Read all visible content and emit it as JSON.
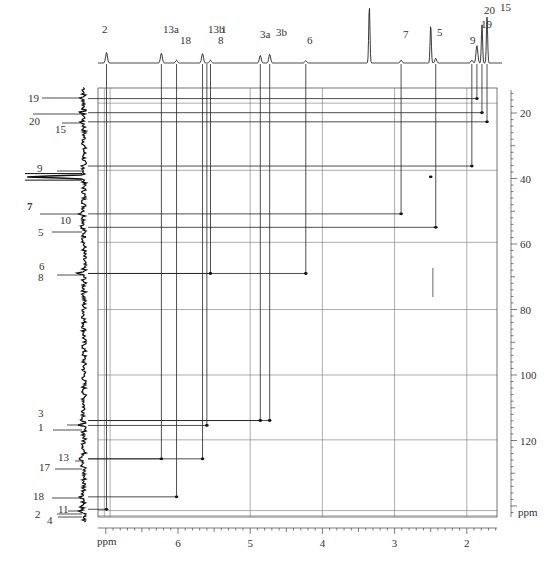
{
  "chart_data": {
    "type": "heatmap",
    "title": "",
    "subtitle": "2D HSQC NMR spectrum (1H-13C correlation)",
    "xlabel": "ppm",
    "ylabel": "ppm",
    "x_axis": {
      "label": "ppm",
      "ticks": [
        6,
        5,
        4,
        3,
        2
      ],
      "range": [
        7.05,
        1.55
      ],
      "reversed": true
    },
    "y_axis": {
      "label": "ppm",
      "ticks": [
        20,
        40,
        60,
        80,
        100,
        120
      ],
      "range": [
        13,
        144
      ],
      "position": "right"
    },
    "grid": true,
    "top_projection": {
      "label": "1H spectrum",
      "peaks": [
        {
          "label": "2",
          "ppm": 6.99,
          "height": 0.18
        },
        {
          "label": "13a",
          "ppm": 6.23,
          "height": 0.17
        },
        {
          "label": "18",
          "ppm": 6.02,
          "height": 0.05
        },
        {
          "label": "13b",
          "ppm": 5.66,
          "height": 0.16
        },
        {
          "label": "1",
          "ppm": 5.6,
          "height": 0.0
        },
        {
          "label": "8",
          "ppm": 5.55,
          "height": 0.05
        },
        {
          "label": "3a",
          "ppm": 4.86,
          "height": 0.13
        },
        {
          "label": "3b",
          "ppm": 4.73,
          "height": 0.15
        },
        {
          "label": "6",
          "ppm": 4.23,
          "height": 0.04
        },
        {
          "label": "",
          "ppm": 3.35,
          "height": 0.98
        },
        {
          "label": "7",
          "ppm": 2.91,
          "height": 0.05
        },
        {
          "label": "",
          "ppm": 2.5,
          "height": 0.66
        },
        {
          "label": "5",
          "ppm": 2.43,
          "height": 0.08
        },
        {
          "label": "9",
          "ppm": 1.93,
          "height": 0.05
        },
        {
          "label": "19",
          "ppm": 1.86,
          "height": 0.3
        },
        {
          "label": "20",
          "ppm": 1.79,
          "height": 0.66
        },
        {
          "label": "15",
          "ppm": 1.72,
          "height": 0.79
        }
      ]
    },
    "left_projection": {
      "label": "13C spectrum",
      "peaks": [
        {
          "label": "19",
          "ppm": 15.6
        },
        {
          "label": "20",
          "ppm": 19.9
        },
        {
          "label": "15",
          "ppm": 22.7
        },
        {
          "label": "9",
          "ppm": 36.2
        },
        {
          "label": "",
          "ppm": 39.5,
          "note": "solvent"
        },
        {
          "label": "10",
          "ppm": 50.8
        },
        {
          "label": "5",
          "ppm": 54.9
        },
        {
          "label": "6",
          "ppm": 69.0
        },
        {
          "label": "8",
          "ppm": 69.0
        },
        {
          "label": "3",
          "ppm": 113.9
        },
        {
          "label": "1",
          "ppm": 115.4
        },
        {
          "label": "13",
          "ppm": 125.6
        },
        {
          "label": "17",
          "ppm": 127.6
        },
        {
          "label": "18",
          "ppm": 137.2
        },
        {
          "label": "11",
          "ppm": 140.0
        },
        {
          "label": "2",
          "ppm": 140.9
        },
        {
          "label": "4",
          "ppm": 141.6
        }
      ]
    },
    "left_labels": [
      {
        "text": "19",
        "y": 98
      },
      {
        "text": "20",
        "y": 121
      },
      {
        "text": "15",
        "y": 129
      },
      {
        "text": "9",
        "y": 168
      },
      {
        "text": "7",
        "y": 206
      },
      {
        "text": "10",
        "y": 220
      },
      {
        "text": "5",
        "y": 232
      },
      {
        "text": "6",
        "y": 266
      },
      {
        "text": "8",
        "y": 277
      },
      {
        "text": "3",
        "y": 413
      },
      {
        "text": "1",
        "y": 427
      },
      {
        "text": "13",
        "y": 457
      },
      {
        "text": "17",
        "y": 467
      },
      {
        "text": "18",
        "y": 496
      },
      {
        "text": "11",
        "y": 509
      },
      {
        "text": "2",
        "y": 514
      },
      {
        "text": "4",
        "y": 520
      }
    ],
    "cross_peaks": [
      {
        "assign": "19",
        "h": 1.86,
        "c": 15.6
      },
      {
        "assign": "20",
        "h": 1.79,
        "c": 19.9
      },
      {
        "assign": "15",
        "h": 1.72,
        "c": 22.7
      },
      {
        "assign": "9",
        "h": 1.93,
        "c": 36.2
      },
      {
        "assign": "10",
        "h": 2.91,
        "c": 50.8
      },
      {
        "assign": "5",
        "h": 2.43,
        "c": 54.9
      },
      {
        "assign": "8",
        "h": 5.55,
        "c": 69.0
      },
      {
        "assign": "6",
        "h": 4.23,
        "c": 69.0
      },
      {
        "assign": "3a",
        "h": 4.86,
        "c": 113.9
      },
      {
        "assign": "3b",
        "h": 4.73,
        "c": 113.9
      },
      {
        "assign": "1",
        "h": 5.6,
        "c": 115.4
      },
      {
        "assign": "13a",
        "h": 6.23,
        "c": 125.6
      },
      {
        "assign": "13b",
        "h": 5.66,
        "c": 125.6
      },
      {
        "assign": "18",
        "h": 6.02,
        "c": 137.2
      },
      {
        "assign": "2",
        "h": 6.99,
        "c": 141.0
      },
      {
        "assign": "solvent",
        "h": 2.5,
        "c": 39.5
      }
    ],
    "horizontal_grid_c": [
      17.0,
      37.5,
      59.5,
      80.0,
      100.0,
      119.8,
      141.4,
      143.0
    ],
    "vertical_grid_h": [
      7.02,
      6.94,
      5.0,
      4.0,
      3.0,
      2.0
    ],
    "legend": []
  },
  "labels": {
    "x_unit": "ppm",
    "y_unit": "ppm",
    "x_ticks": [
      "6",
      "5",
      "4",
      "3",
      "2"
    ],
    "y_ticks": [
      "20",
      "40",
      "60",
      "80",
      "100",
      "120"
    ]
  }
}
